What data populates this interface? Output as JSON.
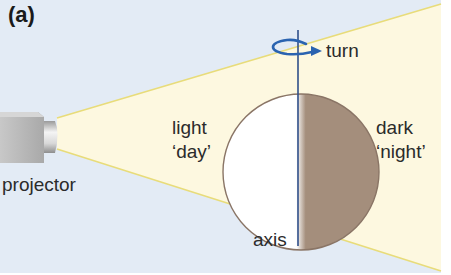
{
  "figure": {
    "panel_label": "(a)",
    "colors": {
      "background": "#e3ebf5",
      "beam_fill": "#fdf8e0",
      "beam_edge": "#e8dc7a",
      "globe_day": "#ffffff",
      "globe_night": "#a48e7c",
      "globe_outline": "#8a7566",
      "axis": "#2f4f8a",
      "turn_arrow": "#2a63b0",
      "projector_body": "#b5b5b5",
      "text": "#2b2b2b"
    }
  },
  "labels": {
    "projector": "projector",
    "light": "light",
    "day": "‘day’",
    "dark": "dark",
    "night": "‘night’",
    "turn": "turn",
    "axis": "axis"
  }
}
